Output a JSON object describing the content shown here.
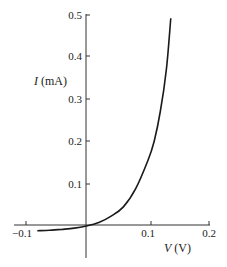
{
  "chart_data": {
    "type": "line",
    "title": "",
    "xlabel": "V (V)",
    "ylabel": "I (mA)",
    "xlabel_var": "V",
    "xlabel_unit": "(V)",
    "ylabel_var": "I",
    "ylabel_unit": "(mA)",
    "xlim": [
      -0.1,
      0.2
    ],
    "ylim": [
      -0.03,
      0.5
    ],
    "x_ticks": [
      -0.1,
      0.1,
      0.2
    ],
    "x_tick_labels": [
      "−0.1",
      "0.1",
      "0.2"
    ],
    "y_ticks": [
      0.1,
      0.2,
      0.3,
      0.4,
      0.5
    ],
    "y_tick_labels": [
      "0.1",
      "0.2",
      "0.3",
      "0.4",
      "0.5"
    ],
    "grid": false,
    "legend": null,
    "series": [
      {
        "name": "diode I-V curve",
        "x": [
          -0.08,
          -0.06,
          -0.04,
          -0.02,
          0.0,
          0.02,
          0.04,
          0.06,
          0.08,
          0.1,
          0.11,
          0.12,
          0.13,
          0.137
        ],
        "y": [
          -0.011,
          -0.01,
          -0.008,
          -0.005,
          0.0,
          0.008,
          0.023,
          0.045,
          0.088,
          0.155,
          0.2,
          0.27,
          0.37,
          0.49
        ]
      }
    ]
  }
}
